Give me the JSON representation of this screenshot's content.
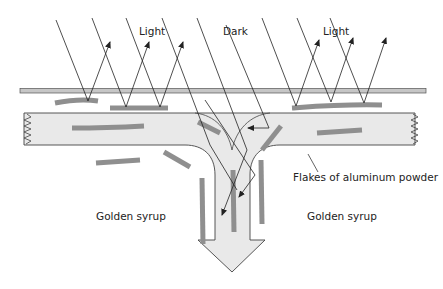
{
  "labels": {
    "light_left": "Light",
    "dark": "Dark",
    "light_right": "Light",
    "flakes": "Flakes of aluminum powder",
    "syrup_left": "Golden syrup",
    "syrup_right": "Golden syrup"
  },
  "colors": {
    "flake": "#8e8e8e",
    "channel_fill": "#e8e8e8",
    "plate_fill": "#c4c4c4",
    "line": "#333333"
  }
}
